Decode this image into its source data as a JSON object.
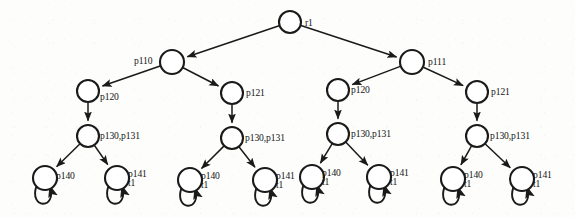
{
  "figure": {
    "type": "tree-diagram",
    "title": "",
    "background_color": "#fdfdfc",
    "stroke_color": "#1a1a1a",
    "node_fill_color": "#ffffff",
    "width": 575,
    "height": 217
  },
  "labels": {
    "root": "r1",
    "level1_left": "p110",
    "level1_right": "p111",
    "level2_a": "p120",
    "level2_b": "p121",
    "level2_c": "p120",
    "level2_d": "p121",
    "level3_a": "p130,p131",
    "level3_b": "p130,p131",
    "level3_c": "p130,p131",
    "level3_d": "p130,p131",
    "leaf1": "p140",
    "leaf1_sub": "",
    "leaf2": "p141",
    "leaf2_sub": "t1",
    "leaf3": "p140",
    "leaf3_sub": "t1",
    "leaf4": "p141",
    "leaf4_sub": "t1",
    "leaf5": "p140",
    "leaf5_sub": "t1",
    "leaf6": "p141",
    "leaf6_sub": "t1",
    "leaf7": "p140",
    "leaf7_sub": "t1",
    "leaf8": "p141",
    "leaf8_sub": "t1"
  },
  "nodes": [
    {
      "id": "root",
      "label": "r1",
      "sub": "",
      "cx": 290,
      "cy": 22,
      "r": 11,
      "label_dx": 15,
      "label_dy": 4
    },
    {
      "id": "n-p110",
      "label": "p110",
      "sub": "",
      "cx": 172,
      "cy": 62,
      "r": 12,
      "label_dx": -38,
      "label_dy": 2
    },
    {
      "id": "n-p111",
      "label": "p111",
      "sub": "",
      "cx": 412,
      "cy": 62,
      "r": 12,
      "label_dx": 16,
      "label_dy": 3
    },
    {
      "id": "n-p120-a",
      "label": "p120",
      "sub": "",
      "cx": 88,
      "cy": 91,
      "r": 11,
      "label_dx": 12,
      "label_dy": 9
    },
    {
      "id": "n-p121-a",
      "label": "p121",
      "sub": "",
      "cx": 232,
      "cy": 93,
      "r": 11,
      "label_dx": 14,
      "label_dy": 3
    },
    {
      "id": "n-p120-b",
      "label": "p120",
      "sub": "",
      "cx": 338,
      "cy": 90,
      "r": 11,
      "label_dx": 13,
      "label_dy": 3
    },
    {
      "id": "n-p121-b",
      "label": "p121",
      "sub": "",
      "cx": 477,
      "cy": 92,
      "r": 11,
      "label_dx": 14,
      "label_dy": 3
    },
    {
      "id": "n-p130-a",
      "label": "p130,p131",
      "sub": "",
      "cx": 88,
      "cy": 136,
      "r": 11,
      "label_dx": 12,
      "label_dy": 3
    },
    {
      "id": "n-p130-b",
      "label": "p130,p131",
      "sub": "",
      "cx": 232,
      "cy": 138,
      "r": 11,
      "label_dx": 13,
      "label_dy": 3
    },
    {
      "id": "n-p130-c",
      "label": "p130,p131",
      "sub": "",
      "cx": 338,
      "cy": 134,
      "r": 11,
      "label_dx": 13,
      "label_dy": 3
    },
    {
      "id": "n-p130-d",
      "label": "p130,p131",
      "sub": "",
      "cx": 477,
      "cy": 136,
      "r": 11,
      "label_dx": 13,
      "label_dy": 3
    },
    {
      "id": "leaf-1",
      "label": "p140",
      "sub": "",
      "cx": 45,
      "cy": 178,
      "r": 12,
      "label_dx": 11,
      "label_dy": 1
    },
    {
      "id": "leaf-2",
      "label": "p141",
      "sub": "t1",
      "cx": 117,
      "cy": 178,
      "r": 12,
      "label_dx": 11,
      "label_dy": -1
    },
    {
      "id": "leaf-3",
      "label": "p140",
      "sub": "t1",
      "cx": 190,
      "cy": 180,
      "r": 12,
      "label_dx": 11,
      "label_dy": -1
    },
    {
      "id": "leaf-4",
      "label": "p141",
      "sub": "t1",
      "cx": 265,
      "cy": 180,
      "r": 12,
      "label_dx": 11,
      "label_dy": -1
    },
    {
      "id": "leaf-5",
      "label": "p140",
      "sub": "t1",
      "cx": 312,
      "cy": 177,
      "r": 12,
      "label_dx": 10,
      "label_dy": -1
    },
    {
      "id": "leaf-6",
      "label": "p141",
      "sub": "t1",
      "cx": 379,
      "cy": 177,
      "r": 12,
      "label_dx": 11,
      "label_dy": -1
    },
    {
      "id": "leaf-7",
      "label": "p140",
      "sub": "t1",
      "cx": 453,
      "cy": 179,
      "r": 12,
      "label_dx": 11,
      "label_dy": -1
    },
    {
      "id": "leaf-8",
      "label": "p141",
      "sub": "t1",
      "cx": 522,
      "cy": 179,
      "r": 12,
      "label_dx": 11,
      "label_dy": -1
    }
  ],
  "edges": [
    {
      "from": "root",
      "to": "n-p110",
      "arrow": true
    },
    {
      "from": "root",
      "to": "n-p111",
      "arrow": true
    },
    {
      "from": "n-p110",
      "to": "n-p120-a",
      "arrow": true
    },
    {
      "from": "n-p110",
      "to": "n-p121-a",
      "arrow": true
    },
    {
      "from": "n-p111",
      "to": "n-p120-b",
      "arrow": true
    },
    {
      "from": "n-p111",
      "to": "n-p121-b",
      "arrow": true
    },
    {
      "from": "n-p120-a",
      "to": "n-p130-a",
      "arrow": true
    },
    {
      "from": "n-p121-a",
      "to": "n-p130-b",
      "arrow": true
    },
    {
      "from": "n-p120-b",
      "to": "n-p130-c",
      "arrow": true
    },
    {
      "from": "n-p121-b",
      "to": "n-p130-d",
      "arrow": true
    },
    {
      "from": "n-p130-a",
      "to": "leaf-1",
      "arrow": true
    },
    {
      "from": "n-p130-a",
      "to": "leaf-2",
      "arrow": true
    },
    {
      "from": "n-p130-b",
      "to": "leaf-3",
      "arrow": true
    },
    {
      "from": "n-p130-b",
      "to": "leaf-4",
      "arrow": true
    },
    {
      "from": "n-p130-c",
      "to": "leaf-5",
      "arrow": true
    },
    {
      "from": "n-p130-c",
      "to": "leaf-6",
      "arrow": true
    },
    {
      "from": "n-p130-d",
      "to": "leaf-7",
      "arrow": true
    },
    {
      "from": "n-p130-d",
      "to": "leaf-8",
      "arrow": true
    }
  ],
  "self_loops": [
    "leaf-1",
    "leaf-2",
    "leaf-3",
    "leaf-4",
    "leaf-5",
    "leaf-6",
    "leaf-7",
    "leaf-8"
  ]
}
